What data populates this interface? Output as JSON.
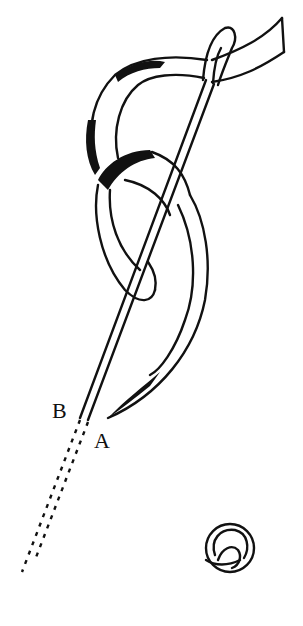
{
  "figure": {
    "type": "needlework stitch illustration",
    "labels": {
      "point_b": "B",
      "point_a": "A"
    },
    "stroke_color": "#111111",
    "background": "#ffffff",
    "elements": [
      "ribbon",
      "needle",
      "ribbon-loop",
      "dashed-needle-path",
      "finished-rose-stitch"
    ]
  }
}
